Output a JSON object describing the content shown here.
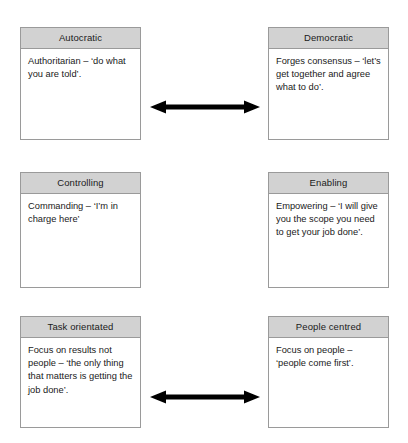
{
  "diagram": {
    "type": "paired-contrast-diagram",
    "colors": {
      "header_fill": "#d2d2d2",
      "box_border": "#9a9a9a",
      "box_fill": "#ffffff",
      "arrow": "#000000",
      "text": "#1a1a1a"
    },
    "pairs": [
      {
        "id": "pair-autocratic-democratic",
        "left": {
          "title": "Autocratic",
          "body": "Authoritarian – ‘do what you are told’."
        },
        "right": {
          "title": "Democratic",
          "body": "Forges consensus – ‘let’s get together and agree what to do’."
        },
        "connector": {
          "name": "double-headed-arrow-icon",
          "direction": "bidirectional"
        }
      },
      {
        "id": "pair-controlling-enabling",
        "left": {
          "title": "Controlling",
          "body": "Commanding – ‘I’m in charge here’"
        },
        "right": {
          "title": "Enabling",
          "body": "Empowering – ‘I will give you the scope you need to get your job done’."
        },
        "connector": {
          "name": "double-headed-arrow-icon",
          "direction": "bidirectional"
        }
      },
      {
        "id": "pair-task-people",
        "left": {
          "title": "Task orientated",
          "body": "Focus on results not people – ‘the only thing that matters is getting the job done’."
        },
        "right": {
          "title": "People centred",
          "body": "Focus on people – ‘people come first’."
        },
        "connector": {
          "name": "double-headed-arrow-icon",
          "direction": "bidirectional"
        }
      }
    ]
  }
}
